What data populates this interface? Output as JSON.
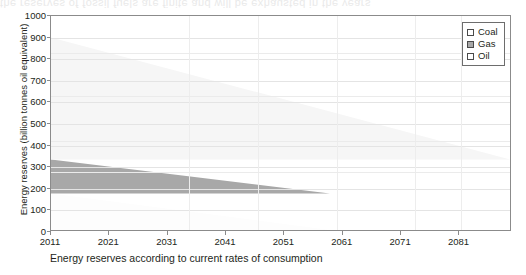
{
  "figure": {
    "bleed_text": "the reserves of fossil fuels are finite and will be exhausted in the years"
  },
  "chart_data": {
    "type": "area",
    "title": "",
    "subtitle": "",
    "xlabel": "Energy reserves according to current rates of consumption",
    "ylabel": "Energy reserves (billion tonnes oil equivalent)",
    "xlim": [
      2011,
      2090
    ],
    "ylim": [
      0,
      1000
    ],
    "xticks": [
      2011,
      2021,
      2031,
      2041,
      2051,
      2061,
      2071,
      2081
    ],
    "yticks": [
      0,
      100,
      200,
      300,
      400,
      500,
      600,
      700,
      800,
      900,
      1000
    ],
    "grid": true,
    "legend_position": "top-right",
    "stacked": true,
    "x": [
      2011,
      2090
    ],
    "series": [
      {
        "name": "Oil",
        "color": "#fdfdfd",
        "swatch_fill": "#ffffff",
        "values": [
          170,
          0
        ],
        "depletion_year": 2059
      },
      {
        "name": "Gas",
        "color": "#a8a8a8",
        "swatch_fill": "#a8a8a8",
        "values": [
          160,
          0
        ],
        "depletion_year": 2059
      },
      {
        "name": "Coal",
        "color": "#f6f6f6",
        "swatch_fill": "#ffffff",
        "values": [
          570,
          0
        ],
        "depletion_year": 2090
      }
    ],
    "totals": {
      "start_year_total": 900,
      "gas_band_lower_2011": 170,
      "gas_band_upper_2011": 330,
      "coal_top_2011": 900
    },
    "legend": [
      {
        "label": "Coal",
        "fill": "#ffffff"
      },
      {
        "label": "Gas",
        "fill": "#a8a8a8"
      },
      {
        "label": "Oil",
        "fill": "#ffffff"
      }
    ]
  }
}
